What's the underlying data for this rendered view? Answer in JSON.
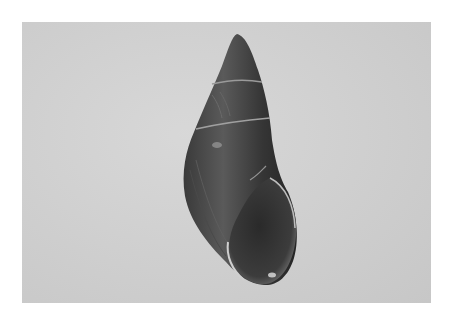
{
  "image": {
    "subject": "snail shell",
    "description": "Photograph of a single elongated, dark glossy land snail shell on a light gray background",
    "colors": {
      "page_background": "#ffffff",
      "photo_background": "#cfcfcf",
      "shell_dark": "#2e2e2e",
      "shell_mid": "#555555",
      "suture_line": "#9a9a9a",
      "highlight": "#d8d8d8"
    }
  }
}
